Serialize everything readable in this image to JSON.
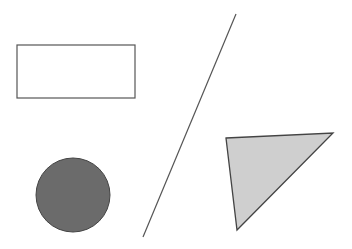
{
  "canvas": {
    "width": 352,
    "height": 249,
    "background": "#ffffff"
  },
  "shapes": {
    "rectangle": {
      "x": 17,
      "y": 45,
      "width": 118,
      "height": 53,
      "fill": "#ffffff",
      "stroke": "#555555",
      "stroke_width": 1.2
    },
    "line": {
      "x1": 236,
      "y1": 14,
      "x2": 143,
      "y2": 237,
      "stroke": "#555555",
      "stroke_width": 1.2
    },
    "circle": {
      "cx": 73,
      "cy": 195,
      "r": 37,
      "fill": "#6b6b6b",
      "stroke": "#444444",
      "stroke_width": 1
    },
    "triangle": {
      "points": "226,138 333,133 237,230",
      "fill": "#cfcfcf",
      "stroke": "#444444",
      "stroke_width": 1.3
    }
  }
}
